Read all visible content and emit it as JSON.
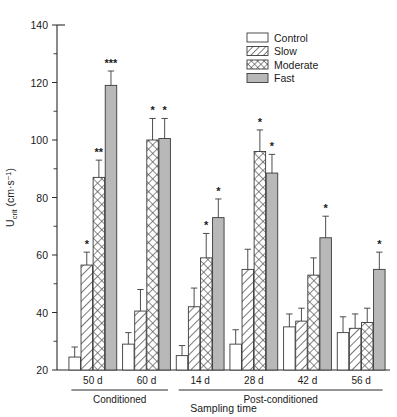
{
  "chart_data": {
    "type": "bar",
    "title": "",
    "xlabel": "Sampling time",
    "ylabel": "Ucrit (cm·s⁻¹)",
    "ylabel_main": "U",
    "ylabel_sub": "crit",
    "ylabel_units": " (cm·s",
    "ylabel_exp": "−1",
    "ylabel_close": ")",
    "ylim": [
      20,
      140
    ],
    "ytick_step": 20,
    "yminor_step": 10,
    "yticks": [
      20,
      40,
      60,
      80,
      100,
      120,
      140
    ],
    "grid": false,
    "legend_position": "top-right",
    "categories": [
      "50 d",
      "60 d",
      "14 d",
      "28 d",
      "42 d",
      "56 d"
    ],
    "phases": [
      {
        "label": "Conditioned",
        "categories": [
          "50 d",
          "60 d"
        ]
      },
      {
        "label": "Post-conditioned",
        "categories": [
          "14 d",
          "28 d",
          "42 d",
          "56 d"
        ]
      }
    ],
    "series": [
      {
        "name": "Control",
        "fill": "none",
        "values": [
          24.5,
          29.0,
          25.0,
          29.0,
          35.0,
          33.0
        ],
        "errors": [
          3.5,
          4.0,
          3.5,
          5.0,
          4.5,
          5.5
        ],
        "significance": [
          "",
          "",
          "",
          "",
          "",
          ""
        ]
      },
      {
        "name": "Slow",
        "fill": "diagonal",
        "values": [
          56.5,
          40.5,
          42.0,
          55.0,
          37.0,
          34.5
        ],
        "errors": [
          4.5,
          7.5,
          6.5,
          7.0,
          4.5,
          5.0
        ],
        "significance": [
          "*",
          "",
          "",
          "",
          "",
          ""
        ]
      },
      {
        "name": "Moderate",
        "fill": "crosshatch",
        "values": [
          87.0,
          100.0,
          59.0,
          96.0,
          53.0,
          36.5
        ],
        "errors": [
          6.0,
          7.5,
          8.5,
          7.5,
          6.0,
          5.0
        ],
        "significance": [
          "**",
          "*",
          "*",
          "*",
          "",
          ""
        ]
      },
      {
        "name": "Fast",
        "fill": "solid-gray",
        "values": [
          119.0,
          100.5,
          73.0,
          88.5,
          66.0,
          55.0
        ],
        "errors": [
          5.0,
          7.0,
          6.5,
          6.5,
          7.5,
          6.0
        ],
        "significance": [
          "***",
          "*",
          "*",
          "*",
          "*",
          "*"
        ]
      }
    ]
  },
  "legend": {
    "items": [
      {
        "label": "Control",
        "fill": "none"
      },
      {
        "label": "Slow",
        "fill": "diagonal"
      },
      {
        "label": "Moderate",
        "fill": "crosshatch"
      },
      {
        "label": "Fast",
        "fill": "solid-gray"
      }
    ]
  },
  "colors": {
    "axis": "#2b2b2b",
    "bar_stroke": "#3a3a3a",
    "fast_fill": "#b8b8b8",
    "background": "#ffffff"
  }
}
